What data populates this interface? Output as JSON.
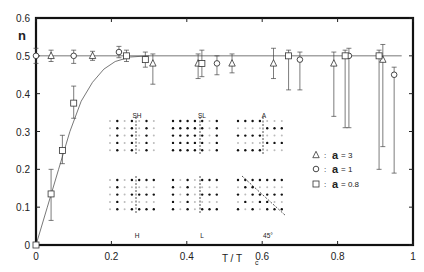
{
  "chart_data": {
    "type": "scatter",
    "title": "",
    "xlabel": "T / Tc",
    "ylabel": "n",
    "xlim": [
      0,
      1
    ],
    "ylim": [
      0,
      0.6
    ],
    "xticks": [
      "0",
      "0.2",
      "0.4",
      "0.6",
      "0.8",
      "1"
    ],
    "yticks": [
      "0",
      "0.1",
      "0.2",
      "0.3",
      "0.4",
      "0.5",
      "0.6"
    ],
    "grid": false,
    "legend_position": "right-middle",
    "series": [
      {
        "name": "a = 3",
        "marker": "triangle",
        "points": [
          {
            "x": 0.04,
            "y": 0.5,
            "err_lo": 0.015,
            "err_hi": 0.015
          },
          {
            "x": 0.15,
            "y": 0.5,
            "err_lo": 0.012,
            "err_hi": 0.012
          },
          {
            "x": 0.31,
            "y": 0.48,
            "err_lo": 0.055,
            "err_hi": 0.025
          },
          {
            "x": 0.43,
            "y": 0.48,
            "err_lo": 0.04,
            "err_hi": 0.025
          },
          {
            "x": 0.52,
            "y": 0.48,
            "err_lo": 0.025,
            "err_hi": 0.025
          },
          {
            "x": 0.63,
            "y": 0.48,
            "err_lo": 0.04,
            "err_hi": 0.04
          },
          {
            "x": 0.79,
            "y": 0.48,
            "err_lo": 0.14,
            "err_hi": 0.03
          },
          {
            "x": 0.92,
            "y": 0.49,
            "err_lo": 0.23,
            "err_hi": 0.04
          }
        ]
      },
      {
        "name": "a = 1",
        "marker": "circle",
        "points": [
          {
            "x": 0.0,
            "y": 0.5,
            "err_lo": 0.02,
            "err_hi": 0.02
          },
          {
            "x": 0.1,
            "y": 0.5,
            "err_lo": 0.02,
            "err_hi": 0.015
          },
          {
            "x": 0.22,
            "y": 0.51,
            "err_lo": 0.015,
            "err_hi": 0.015
          },
          {
            "x": 0.48,
            "y": 0.48,
            "err_lo": 0.03,
            "err_hi": 0.02
          },
          {
            "x": 0.7,
            "y": 0.49,
            "err_lo": 0.08,
            "err_hi": 0.02
          },
          {
            "x": 0.83,
            "y": 0.5,
            "err_lo": 0.19,
            "err_hi": 0.02
          },
          {
            "x": 0.95,
            "y": 0.45,
            "err_lo": 0.26,
            "err_hi": 0.02
          }
        ]
      },
      {
        "name": "a = 0.8",
        "marker": "square",
        "points": [
          {
            "x": 0.0,
            "y": 0.0,
            "err_lo": 0.0,
            "err_hi": 0.0
          },
          {
            "x": 0.04,
            "y": 0.135,
            "err_lo": 0.07,
            "err_hi": 0.065
          },
          {
            "x": 0.07,
            "y": 0.25,
            "err_lo": 0.035,
            "err_hi": 0.04
          },
          {
            "x": 0.1,
            "y": 0.375,
            "err_lo": 0.04,
            "err_hi": 0.045
          },
          {
            "x": 0.24,
            "y": 0.5,
            "err_lo": 0.015,
            "err_hi": 0.015
          },
          {
            "x": 0.29,
            "y": 0.49,
            "err_lo": 0.02,
            "err_hi": 0.02
          },
          {
            "x": 0.44,
            "y": 0.48,
            "err_lo": 0.035,
            "err_hi": 0.035
          },
          {
            "x": 0.67,
            "y": 0.5,
            "err_lo": 0.09,
            "err_hi": 0.015
          },
          {
            "x": 0.82,
            "y": 0.5,
            "err_lo": 0.19,
            "err_hi": 0.015
          },
          {
            "x": 0.91,
            "y": 0.5,
            "err_lo": 0.3,
            "err_hi": 0.015
          }
        ]
      }
    ],
    "reference_line": {
      "y": 0.5,
      "from_x": 0.0,
      "to_x": 0.97
    },
    "fit_curve": {
      "description": "curve rising from (0,0) saturating at 0.5 near x≈0.25",
      "points": [
        [
          0,
          0
        ],
        [
          0.03,
          0.1
        ],
        [
          0.06,
          0.2
        ],
        [
          0.09,
          0.3
        ],
        [
          0.12,
          0.38
        ],
        [
          0.15,
          0.43
        ],
        [
          0.18,
          0.465
        ],
        [
          0.21,
          0.485
        ],
        [
          0.25,
          0.497
        ],
        [
          0.3,
          0.5
        ]
      ]
    },
    "legend": [
      {
        "marker": "triangle",
        "label": "a = 3"
      },
      {
        "marker": "circle",
        "label": "a = 1"
      },
      {
        "marker": "square",
        "label": "a = 0.8"
      }
    ],
    "annotations": {
      "inset_panels": [
        {
          "label": "SH",
          "position": "top"
        },
        {
          "label": "SL",
          "position": "top"
        },
        {
          "label": "A",
          "position": "top"
        },
        {
          "label": "H",
          "position": "bottom"
        },
        {
          "label": "L",
          "position": "bottom"
        },
        {
          "label": "45°",
          "position": "bottom"
        }
      ]
    }
  },
  "labels": {
    "ylabel": "n",
    "xlabel_main": "T / T",
    "xlabel_sub": "c",
    "legend_sym": ":",
    "legend_a": "a",
    "legend_vals": [
      "= 3",
      "= 1",
      "= 0.8"
    ]
  }
}
